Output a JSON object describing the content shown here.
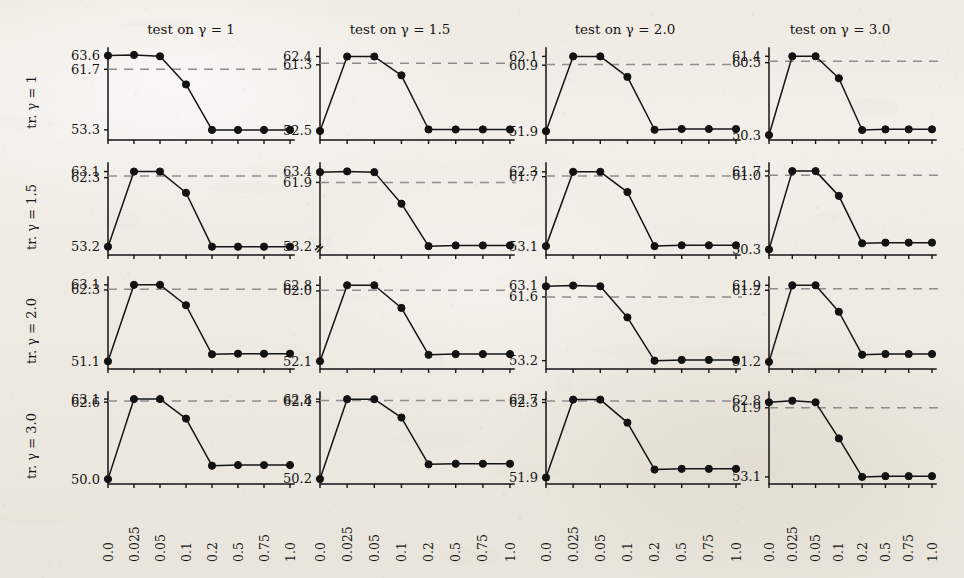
{
  "figure": {
    "title": "",
    "column_titles": [
      "test on γ = 1",
      "test on γ = 1.5",
      "test on γ = 2.0",
      "test on γ = 3.0"
    ],
    "row_labels": [
      "tr. γ = 1",
      "tr. γ = 1.5",
      "tr. γ = 2.0",
      "tr. γ = 3.0"
    ],
    "x_tick_labels": [
      "0.0",
      "0.025",
      "0.05",
      "0.1",
      "0.2",
      "0.5",
      "0.75",
      "1.0"
    ],
    "line_color": "#141414",
    "marker_color": "#121212",
    "baseline_color": "#8d8d8d",
    "paper_color": "#efece6"
  },
  "chart_data": {
    "type": "line",
    "title": "",
    "xlabel": "",
    "ylabel": "",
    "grid": false,
    "legend": "none",
    "layout": {
      "rows": 4,
      "cols": 4
    },
    "x": [
      0.0,
      0.025,
      0.05,
      0.1,
      0.2,
      0.5,
      0.75,
      1.0
    ],
    "x_tick_labels": [
      "0.0",
      "0.025",
      "0.05",
      "0.1",
      "0.2",
      "0.5",
      "0.75",
      "1.0"
    ],
    "row_titles": [
      "tr. γ = 1",
      "tr. γ = 1.5",
      "tr. γ = 2.0",
      "tr. γ = 3.0"
    ],
    "col_titles": [
      "test on γ = 1",
      "test on γ = 1.5",
      "test on γ = 2.0",
      "test on γ = 3.0"
    ],
    "panels": [
      {
        "row": 0,
        "col": 0,
        "row_label": "tr. γ = 1",
        "col_title": "test on γ = 1",
        "y_tick_labels": [
          "63.6",
          "61.7",
          "53.3"
        ],
        "y_ticks": [
          63.6,
          61.7,
          53.3
        ],
        "ylim": [
          51.9,
          64.1
        ],
        "baseline": 61.7,
        "broken_axis": false,
        "values": [
          63.6,
          63.7,
          63.5,
          59.6,
          53.3,
          53.3,
          53.3,
          53.3
        ]
      },
      {
        "row": 0,
        "col": 1,
        "row_label": "tr. γ = 1",
        "col_title": "test on γ = 1.5",
        "y_tick_labels": [
          "62.4",
          "61.3",
          "52.5"
        ],
        "y_ticks": [
          62.4,
          61.3,
          52.5
        ],
        "ylim": [
          51.3,
          63.0
        ],
        "baseline": 61.5,
        "broken_axis": false,
        "values": [
          52.5,
          62.4,
          62.4,
          59.9,
          52.7,
          52.7,
          52.7,
          52.7
        ]
      },
      {
        "row": 0,
        "col": 2,
        "row_label": "tr. γ = 1",
        "col_title": "test on γ = 2.0",
        "y_tick_labels": [
          "62.1",
          "60.9",
          "51.9"
        ],
        "y_ticks": [
          62.1,
          60.9,
          51.9
        ],
        "ylim": [
          50.7,
          62.7
        ],
        "baseline": 61.0,
        "broken_axis": false,
        "values": [
          51.9,
          62.1,
          62.1,
          59.3,
          52.1,
          52.2,
          52.2,
          52.2
        ]
      },
      {
        "row": 0,
        "col": 3,
        "row_label": "tr. γ = 1",
        "col_title": "test on γ = 3.0",
        "y_tick_labels": [
          "61.4",
          "60.5",
          "50.3"
        ],
        "y_ticks": [
          61.4,
          60.5,
          50.3
        ],
        "ylim": [
          49.6,
          62.0
        ],
        "baseline": 60.7,
        "broken_axis": false,
        "values": [
          50.3,
          61.4,
          61.4,
          58.3,
          51.0,
          51.1,
          51.1,
          51.1
        ]
      },
      {
        "row": 1,
        "col": 0,
        "row_label": "tr. γ = 1.5",
        "col_title": "test on γ = 1",
        "y_tick_labels": [
          "63.1",
          "62.3",
          "53.2"
        ],
        "y_ticks": [
          63.1,
          62.3,
          53.2
        ],
        "ylim": [
          52.1,
          63.7
        ],
        "baseline": 62.5,
        "broken_axis": false,
        "values": [
          53.2,
          63.1,
          63.1,
          60.3,
          53.2,
          53.2,
          53.2,
          53.2
        ]
      },
      {
        "row": 1,
        "col": 1,
        "row_label": "tr. γ = 1.5",
        "col_title": "test on γ = 1.5",
        "y_tick_labels": [
          "63.4",
          "61.9",
          "53.2"
        ],
        "y_ticks": [
          63.4,
          61.9,
          53.2
        ],
        "ylim": [
          52.0,
          64.0
        ],
        "baseline": 61.9,
        "broken_axis": true,
        "values": [
          63.3,
          63.4,
          63.3,
          59.0,
          53.2,
          53.3,
          53.3,
          53.3
        ]
      },
      {
        "row": 1,
        "col": 2,
        "row_label": "tr. γ = 1.5",
        "col_title": "test on γ = 2.0",
        "y_tick_labels": [
          "62.3",
          "61.7",
          "53.1"
        ],
        "y_ticks": [
          62.3,
          61.7,
          53.1
        ],
        "ylim": [
          52.0,
          62.9
        ],
        "baseline": 61.8,
        "broken_axis": false,
        "values": [
          53.1,
          62.3,
          62.3,
          59.8,
          53.1,
          53.2,
          53.2,
          53.2
        ]
      },
      {
        "row": 1,
        "col": 3,
        "row_label": "tr. γ = 1.5",
        "col_title": "test on γ = 3.0",
        "y_tick_labels": [
          "61.7",
          "61.0",
          "50.3"
        ],
        "y_ticks": [
          61.7,
          61.0,
          50.3
        ],
        "ylim": [
          49.5,
          62.3
        ],
        "baseline": 61.1,
        "broken_axis": false,
        "values": [
          50.3,
          61.7,
          61.7,
          58.1,
          51.2,
          51.3,
          51.3,
          51.3
        ]
      },
      {
        "row": 2,
        "col": 0,
        "row_label": "tr. γ = 2.0",
        "col_title": "test on γ = 1",
        "y_tick_labels": [
          "63.1",
          "62.3",
          "51.1"
        ],
        "y_ticks": [
          63.1,
          62.3,
          51.1
        ],
        "ylim": [
          49.9,
          63.7
        ],
        "baseline": 62.4,
        "broken_axis": false,
        "values": [
          51.1,
          63.1,
          63.1,
          59.9,
          52.2,
          52.3,
          52.3,
          52.3
        ]
      },
      {
        "row": 2,
        "col": 1,
        "row_label": "tr. γ = 2.0",
        "col_title": "test on γ = 1.5",
        "y_tick_labels": [
          "62.8",
          "62.0",
          "52.1"
        ],
        "y_ticks": [
          62.8,
          62.0,
          52.1
        ],
        "ylim": [
          51.0,
          63.4
        ],
        "baseline": 62.1,
        "broken_axis": false,
        "values": [
          52.1,
          62.8,
          62.8,
          59.6,
          53.0,
          53.1,
          53.1,
          53.1
        ]
      },
      {
        "row": 2,
        "col": 2,
        "row_label": "tr. γ = 2.0",
        "col_title": "test on γ = 2.0",
        "y_tick_labels": [
          "63.1",
          "61.6",
          "53.2"
        ],
        "y_ticks": [
          63.1,
          61.6,
          53.2
        ],
        "ylim": [
          52.1,
          63.7
        ],
        "baseline": 61.6,
        "broken_axis": false,
        "values": [
          63.0,
          63.1,
          63.0,
          58.9,
          53.2,
          53.3,
          53.3,
          53.3
        ]
      },
      {
        "row": 2,
        "col": 3,
        "row_label": "tr. γ = 2.0",
        "col_title": "test on γ = 3.0",
        "y_tick_labels": [
          "61.9",
          "61.2",
          "51.2"
        ],
        "y_ticks": [
          61.9,
          61.2,
          51.2
        ],
        "ylim": [
          50.2,
          62.5
        ],
        "baseline": 61.4,
        "broken_axis": false,
        "values": [
          51.2,
          61.9,
          61.9,
          58.2,
          52.2,
          52.3,
          52.3,
          52.3
        ]
      },
      {
        "row": 3,
        "col": 0,
        "row_label": "tr. γ = 3.0",
        "col_title": "test on γ = 1",
        "y_tick_labels": [
          "63.1",
          "62.6",
          "50.0"
        ],
        "y_ticks": [
          63.1,
          62.6,
          50.0
        ],
        "ylim": [
          49.2,
          63.6
        ],
        "baseline": 62.8,
        "broken_axis": false,
        "values": [
          50.0,
          63.1,
          63.1,
          59.9,
          52.2,
          52.3,
          52.3,
          52.3
        ]
      },
      {
        "row": 3,
        "col": 1,
        "row_label": "tr. γ = 3.0",
        "col_title": "test on γ = 1.5",
        "y_tick_labels": [
          "62.8",
          "62.4",
          "50.2"
        ],
        "y_ticks": [
          62.8,
          62.4,
          50.2
        ],
        "ylim": [
          49.4,
          63.3
        ],
        "baseline": 62.6,
        "broken_axis": false,
        "values": [
          50.2,
          62.8,
          62.8,
          59.9,
          52.5,
          52.6,
          52.6,
          52.6
        ]
      },
      {
        "row": 3,
        "col": 2,
        "row_label": "tr. γ = 3.0",
        "col_title": "test on γ = 2.0",
        "y_tick_labels": [
          "62.7",
          "62.3",
          "51.9"
        ],
        "y_ticks": [
          62.7,
          62.3,
          51.9
        ],
        "ylim": [
          51.0,
          63.2
        ],
        "baseline": 62.5,
        "broken_axis": false,
        "values": [
          51.9,
          62.7,
          62.7,
          59.5,
          53.0,
          53.1,
          53.1,
          53.1
        ]
      },
      {
        "row": 3,
        "col": 3,
        "row_label": "tr. γ = 3.0",
        "col_title": "test on γ = 3.0",
        "y_tick_labels": [
          "62.8",
          "61.9",
          "53.1"
        ],
        "y_ticks": [
          62.8,
          61.9,
          53.1
        ],
        "ylim": [
          52.2,
          63.4
        ],
        "baseline": 61.9,
        "broken_axis": false,
        "values": [
          62.6,
          62.8,
          62.6,
          58.0,
          53.1,
          53.2,
          53.2,
          53.2
        ]
      }
    ]
  }
}
